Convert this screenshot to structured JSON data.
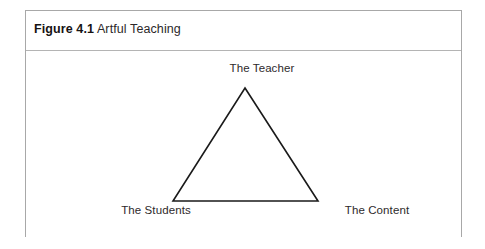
{
  "figure": {
    "caption_number": "Figure 4.1",
    "caption_title": "Artful Teaching"
  },
  "diagram": {
    "type": "triangle-diagram",
    "shape": "triangle",
    "nodes": [
      {
        "id": "teacher",
        "label": "The Teacher",
        "position": "apex"
      },
      {
        "id": "students",
        "label": "The Students",
        "position": "bottom-left"
      },
      {
        "id": "content",
        "label": "The Content",
        "position": "bottom-right"
      }
    ],
    "colors": {
      "stroke": "#1a1a1a",
      "fill": "#ffffff",
      "frame_border": "#a8a8a8",
      "text": "#2e2a2b"
    }
  }
}
